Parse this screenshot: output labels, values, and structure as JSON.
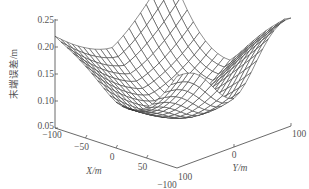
{
  "chart_data": {
    "type": "surface3d",
    "title": "",
    "xlabel": "X/m",
    "ylabel": "Y/m",
    "zlabel": "末端误差/m",
    "xlim": [
      -100,
      100
    ],
    "ylim": [
      -100,
      100
    ],
    "zlim": [
      0.05,
      0.25
    ],
    "x_ticks": [
      "−100",
      "−50",
      "0",
      "50",
      "100"
    ],
    "x_tick_values": [
      -100,
      -50,
      0,
      50,
      100
    ],
    "y_ticks": [
      "−100",
      "0",
      "100"
    ],
    "y_tick_values": [
      -100,
      0,
      100
    ],
    "z_ticks": [
      "0.05",
      "0.10",
      "0.15",
      "0.20",
      "0.25"
    ],
    "z_tick_values": [
      0.05,
      0.1,
      0.15,
      0.2,
      0.25
    ],
    "grid": false,
    "surface": {
      "description": "wireframe error surface: high ridges near the back corners (~0.25 m), deep central valley (~0.06 m), undulating edges",
      "x_range": [
        -100,
        100
      ],
      "y_range": [
        -100,
        100
      ],
      "resolution": 20,
      "z_min": 0.06,
      "z_max": 0.25
    }
  }
}
